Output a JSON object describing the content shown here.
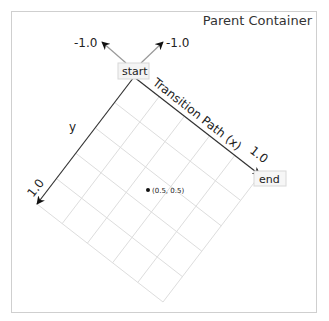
{
  "container": {
    "title": "Parent Container"
  },
  "diagram": {
    "start_label": "start",
    "end_label": "end",
    "x_axis_label": "Transition Path (x)",
    "y_axis_label": "y",
    "x_end_tick": "1.0",
    "y_end_tick": "1.0",
    "neg_x_tick": "-1.0",
    "neg_y_tick": "-1.0",
    "point_label": "(0.5, 0.5)",
    "grid_divisions": 5,
    "colors": {
      "axis": "#333333",
      "grid": "#dddddd",
      "neg_axis": "#999999",
      "box_border": "#d8d8d8",
      "box_fill": "#f4f4f4"
    }
  }
}
